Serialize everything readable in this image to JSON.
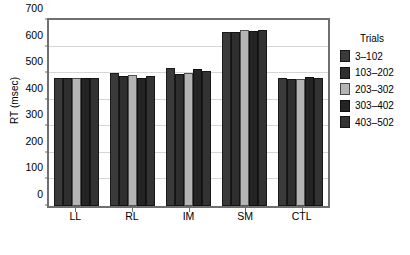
{
  "chart_data": {
    "type": "bar",
    "title": "",
    "xlabel": "",
    "ylabel": "RT (msec)",
    "categories": [
      "LL",
      "RL",
      "IM",
      "SM",
      "CTL"
    ],
    "ylim": [
      0,
      700
    ],
    "yticks": [
      0,
      100,
      200,
      300,
      400,
      500,
      600,
      700
    ],
    "grid": true,
    "legend_position": "right",
    "legend_title": "Trials",
    "series": [
      {
        "name": "3–102",
        "color": "#3a3a3a",
        "values": [
          482,
          500,
          518,
          655,
          481
        ]
      },
      {
        "name": "103–202",
        "color": "#2e2e2e",
        "values": [
          481,
          489,
          497,
          654,
          478
        ]
      },
      {
        "name": "203–302",
        "color": "#b4b4b4",
        "values": [
          480,
          492,
          501,
          661,
          477
        ]
      },
      {
        "name": "303–402",
        "color": "#242424",
        "values": [
          482,
          481,
          515,
          658,
          484
        ]
      },
      {
        "name": "403–502",
        "color": "#333333",
        "values": [
          483,
          489,
          510,
          664,
          483
        ]
      }
    ]
  }
}
